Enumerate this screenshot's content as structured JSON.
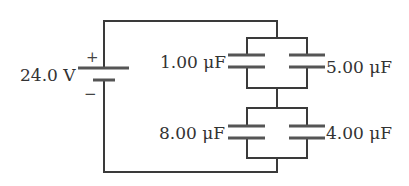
{
  "diagram": {
    "type": "circuit",
    "battery": {
      "label": "24.0 V",
      "plus": "+",
      "minus": "−"
    },
    "capacitors": [
      {
        "id": "C1",
        "label": "1.00 μF",
        "position": "upper-left"
      },
      {
        "id": "C2",
        "label": "5.00 μF",
        "position": "upper-right"
      },
      {
        "id": "C3",
        "label": "8.00 μF",
        "position": "lower-left"
      },
      {
        "id": "C4",
        "label": "4.00 μF",
        "position": "lower-right"
      }
    ],
    "topology": "(C1 || C2) in series with (C3 || C4), connected across battery"
  }
}
